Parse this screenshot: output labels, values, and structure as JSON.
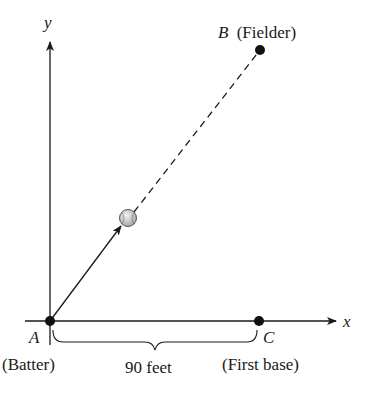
{
  "diagram": {
    "axes": {
      "x_label": "x",
      "y_label": "y"
    },
    "points": {
      "A": {
        "letter": "A",
        "desc": "(Batter)"
      },
      "B": {
        "letter": "B",
        "desc": "(Fielder)"
      },
      "C": {
        "letter": "C",
        "desc": "(First base)"
      }
    },
    "distance_label": "90 feet",
    "colors": {
      "line": "#1a1a1a",
      "ball_fill": "#d8d8d8",
      "ball_stroke": "#555555"
    }
  }
}
